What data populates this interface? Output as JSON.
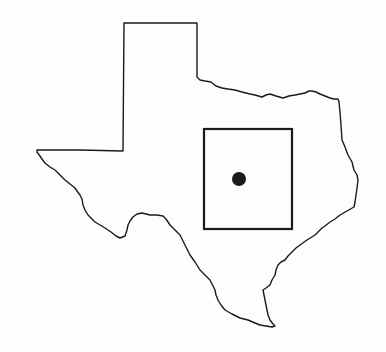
{
  "map": {
    "type": "locator-map",
    "region": "Texas",
    "width": 386,
    "height": 352,
    "background_color": "#fdfdfd",
    "stroke_color": "#1a1a1a",
    "outline": {
      "name": "texas-state-outline",
      "points": [
        [
          124,
          23
        ],
        [
          197,
          23
        ],
        [
          197,
          77
        ],
        [
          200,
          80
        ],
        [
          205,
          81
        ],
        [
          211,
          82
        ],
        [
          216,
          86
        ],
        [
          222,
          88
        ],
        [
          228,
          89
        ],
        [
          235,
          90
        ],
        [
          242,
          92
        ],
        [
          250,
          94
        ],
        [
          255,
          95
        ],
        [
          262,
          97
        ],
        [
          266,
          95
        ],
        [
          270,
          94
        ],
        [
          276,
          96
        ],
        [
          283,
          98
        ],
        [
          289,
          96
        ],
        [
          295,
          95
        ],
        [
          300,
          94
        ],
        [
          305,
          93
        ],
        [
          309,
          91
        ],
        [
          312,
          91
        ],
        [
          316,
          92
        ],
        [
          320,
          94
        ],
        [
          325,
          96
        ],
        [
          330,
          98
        ],
        [
          334,
          99
        ],
        [
          338,
          99
        ],
        [
          339,
          102
        ],
        [
          340,
          112
        ],
        [
          341,
          125
        ],
        [
          342,
          140
        ],
        [
          345,
          147
        ],
        [
          348,
          155
        ],
        [
          352,
          162
        ],
        [
          354,
          170
        ],
        [
          357,
          175
        ],
        [
          358,
          180
        ],
        [
          357,
          188
        ],
        [
          356,
          195
        ],
        [
          355,
          202
        ],
        [
          354,
          207
        ],
        [
          347,
          211
        ],
        [
          340,
          215
        ],
        [
          335,
          219
        ],
        [
          330,
          222
        ],
        [
          325,
          226
        ],
        [
          322,
          228
        ],
        [
          318,
          232
        ],
        [
          315,
          235
        ],
        [
          307,
          240
        ],
        [
          300,
          245
        ],
        [
          296,
          248
        ],
        [
          292,
          252
        ],
        [
          288,
          256
        ],
        [
          285,
          260
        ],
        [
          281,
          262
        ],
        [
          278,
          265
        ],
        [
          276,
          270
        ],
        [
          275,
          275
        ],
        [
          272,
          280
        ],
        [
          270,
          285
        ],
        [
          266,
          288
        ],
        [
          263,
          290
        ],
        [
          264,
          295
        ],
        [
          265,
          300
        ],
        [
          266,
          305
        ],
        [
          267,
          310
        ],
        [
          268,
          315
        ],
        [
          270,
          320
        ],
        [
          273,
          324
        ],
        [
          275,
          326
        ],
        [
          272,
          327
        ],
        [
          266,
          326
        ],
        [
          260,
          325
        ],
        [
          255,
          323
        ],
        [
          248,
          320
        ],
        [
          240,
          318
        ],
        [
          232,
          314
        ],
        [
          225,
          310
        ],
        [
          221,
          305
        ],
        [
          218,
          300
        ],
        [
          216,
          295
        ],
        [
          215,
          290
        ],
        [
          212,
          284
        ],
        [
          210,
          280
        ],
        [
          205,
          275
        ],
        [
          200,
          270
        ],
        [
          195,
          262
        ],
        [
          190,
          255
        ],
        [
          186,
          247
        ],
        [
          183,
          241
        ],
        [
          180,
          235
        ],
        [
          175,
          230
        ],
        [
          170,
          225
        ],
        [
          166,
          219
        ],
        [
          163,
          216
        ],
        [
          157,
          215
        ],
        [
          150,
          215
        ],
        [
          146,
          214
        ],
        [
          142,
          213
        ],
        [
          137,
          214
        ],
        [
          133,
          217
        ],
        [
          130,
          221
        ],
        [
          128,
          225
        ],
        [
          127,
          230
        ],
        [
          125,
          236
        ],
        [
          120,
          238
        ],
        [
          116,
          236
        ],
        [
          111,
          232
        ],
        [
          105,
          228
        ],
        [
          100,
          225
        ],
        [
          95,
          222
        ],
        [
          91,
          218
        ],
        [
          88,
          215
        ],
        [
          85,
          210
        ],
        [
          83,
          205
        ],
        [
          82,
          199
        ],
        [
          80,
          195
        ],
        [
          77,
          191
        ],
        [
          75,
          188
        ],
        [
          70,
          184
        ],
        [
          65,
          180
        ],
        [
          60,
          175
        ],
        [
          55,
          170
        ],
        [
          50,
          167
        ],
        [
          45,
          163
        ],
        [
          42,
          159
        ],
        [
          40,
          156
        ],
        [
          37,
          152
        ],
        [
          37,
          150
        ],
        [
          80,
          150
        ],
        [
          123,
          151
        ],
        [
          124,
          23
        ]
      ]
    },
    "study_area": {
      "name": "study-area-rectangle",
      "x": 204,
      "y": 129,
      "width": 88,
      "height": 100,
      "stroke_width": 2.2
    },
    "site_marker": {
      "name": "site-location-dot",
      "cx": 239,
      "cy": 179,
      "r": 7
    }
  }
}
